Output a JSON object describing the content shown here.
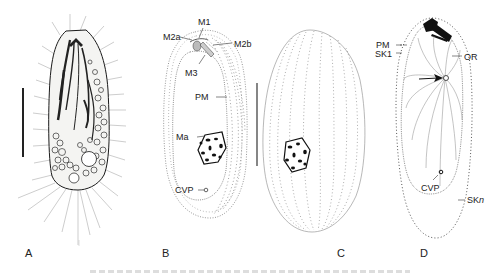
{
  "figure": {
    "panels": [
      {
        "id": "A",
        "label": "A",
        "description": "live cell photomicrograph-style drawing"
      },
      {
        "id": "B",
        "label": "B",
        "description": "ventral view, oral structures"
      },
      {
        "id": "C",
        "label": "C",
        "description": "dorsal view, kineties"
      },
      {
        "id": "D",
        "label": "D",
        "description": "silverline / somatic kineties view"
      }
    ],
    "annotations": {
      "B": [
        "M1",
        "M2a",
        "M2b",
        "M3",
        "PM",
        "Ma",
        "CVP"
      ],
      "D": [
        "PM",
        "SK1",
        "OR",
        "CVP",
        "SKn"
      ]
    },
    "labels": {
      "m1": "M1",
      "m2a": "M2a",
      "m2b": "M2b",
      "m3": "M3",
      "pm_b": "PM",
      "ma": "Ma",
      "cvp_b": "CVP",
      "pm_d": "PM",
      "sk1": "SK1",
      "or": "OR",
      "cvp_d": "CVP",
      "skn_main": "SK",
      "skn_sub": "n"
    },
    "colors": {
      "ink": "#1a1a1a",
      "dots": "#666666",
      "background": "#ffffff"
    }
  }
}
